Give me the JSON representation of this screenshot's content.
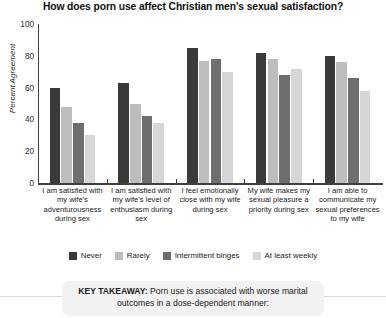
{
  "chart_data": {
    "type": "bar",
    "title": "How does porn use affect Christian men's sexual satisfaction?",
    "xlabel": "",
    "ylabel": "Percent Agreement",
    "ylim": [
      0,
      100
    ],
    "yticks": [
      0,
      20,
      40,
      60,
      80,
      100
    ],
    "grid": false,
    "legend_position": "bottom",
    "categories": [
      "I am satisfied with my wife's adventurousness during sex",
      "I am satisfied with my wife's level of enthusiasm during sex",
      "I feel emotionally close with my wife during sex",
      "My wife makes my sexual pleasure a priority during sex",
      "I am able to communicate my sexual preferences to my wife"
    ],
    "series": [
      {
        "name": "Never",
        "color": "#3a3a3a",
        "values": [
          60,
          63,
          85,
          82,
          80
        ]
      },
      {
        "name": "Rarely",
        "color": "#bdbdbd",
        "values": [
          48,
          50,
          77,
          78,
          76
        ]
      },
      {
        "name": "Intermittent binges",
        "color": "#6e6e6e",
        "values": [
          38,
          42,
          78,
          68,
          66
        ]
      },
      {
        "name": "At least weekly",
        "color": "#d6d6d6",
        "values": [
          30,
          38,
          70,
          72,
          58
        ]
      }
    ]
  },
  "takeaway": {
    "label": "KEY TAKEAWAY:",
    "body": " Porn use is associated with worse marital outcomes in a dose-dependent manner:"
  }
}
